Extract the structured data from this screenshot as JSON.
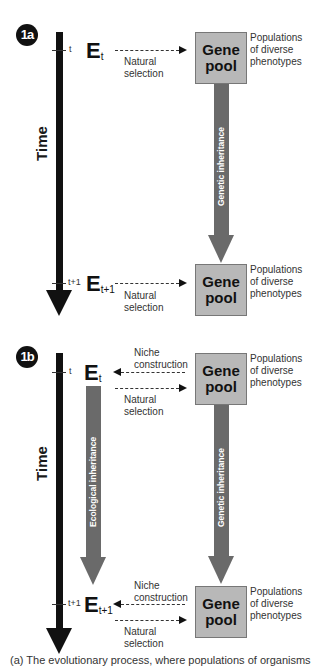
{
  "panel_a": {
    "badge": "1a",
    "time_label": "Time",
    "tick_top": "t",
    "tick_bottom": "t+1",
    "env_top": {
      "letter": "E",
      "sub": "t"
    },
    "env_bottom": {
      "letter": "E",
      "sub": "t+1"
    },
    "natural_selection_top": [
      "Natural",
      "selection"
    ],
    "natural_selection_bottom": [
      "Natural",
      "selection"
    ],
    "gene_pool": [
      "Gene",
      "pool"
    ],
    "populations": [
      "Populations",
      "of diverse",
      "phenotypes"
    ],
    "genetic_inheritance": "Genetic inheritance"
  },
  "panel_b": {
    "badge": "1b",
    "time_label": "Time",
    "tick_top": "t",
    "tick_bottom": "t+1",
    "env_top": {
      "letter": "E",
      "sub": "t"
    },
    "env_bottom": {
      "letter": "E",
      "sub": "t+1"
    },
    "niche_construction_top": [
      "Niche",
      "construction"
    ],
    "niche_construction_bottom": [
      "Niche",
      "construction"
    ],
    "natural_selection_top": [
      "Natural",
      "selection"
    ],
    "natural_selection_bottom": [
      "Natural",
      "selection"
    ],
    "gene_pool": [
      "Gene",
      "pool"
    ],
    "populations": [
      "Populations",
      "of diverse",
      "phenotypes"
    ],
    "genetic_inheritance": "Genetic inheritance",
    "ecological_inheritance": "Ecological inheritance"
  },
  "caption_fragment": "(a) The evolutionary process, where populations of organisms"
}
